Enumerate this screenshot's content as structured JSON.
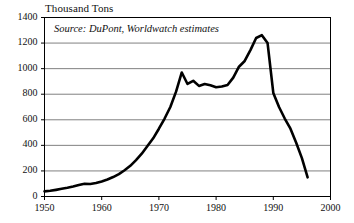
{
  "chart_data": {
    "type": "line",
    "title": "Thousand Tons",
    "ylabel": "Thousand Tons",
    "xlabel": "",
    "annotation": "Source: DuPont, Worldwatch estimates",
    "xlim": [
      1950,
      2000
    ],
    "ylim": [
      0,
      1400
    ],
    "grid": true,
    "legend": "none",
    "line_color": "#000000",
    "grid_color": "#808080",
    "axis_color": "#000000",
    "background_color": "#ffffff",
    "yticks": [
      0,
      200,
      400,
      600,
      800,
      1000,
      1200,
      1400
    ],
    "ytick_labels": [
      "0",
      "200",
      "400",
      "600",
      "800",
      "1000",
      "1200",
      "1400"
    ],
    "xticks": [
      1950,
      1960,
      1970,
      1980,
      1990,
      2000
    ],
    "xtick_labels": [
      "1950",
      "1960",
      "1970",
      "1980",
      "1990",
      "2000"
    ],
    "x": [
      1950,
      1951,
      1952,
      1953,
      1954,
      1955,
      1956,
      1957,
      1958,
      1959,
      1960,
      1961,
      1962,
      1963,
      1964,
      1965,
      1966,
      1967,
      1968,
      1969,
      1970,
      1971,
      1972,
      1973,
      1974,
      1975,
      1976,
      1977,
      1978,
      1979,
      1980,
      1981,
      1982,
      1983,
      1984,
      1985,
      1986,
      1987,
      1988,
      1989,
      1990,
      1991,
      1992,
      1993,
      1994,
      1995,
      1996
    ],
    "values": [
      40,
      45,
      52,
      60,
      68,
      78,
      90,
      100,
      98,
      105,
      118,
      133,
      152,
      175,
      205,
      240,
      285,
      335,
      395,
      455,
      530,
      610,
      700,
      820,
      970,
      880,
      905,
      865,
      880,
      870,
      855,
      860,
      872,
      930,
      1015,
      1060,
      1145,
      1240,
      1262,
      1200,
      810,
      700,
      610,
      530,
      420,
      300,
      150
    ],
    "series": [
      {
        "name": "CFC production",
        "values": [
          40,
          45,
          52,
          60,
          68,
          78,
          90,
          100,
          98,
          105,
          118,
          133,
          152,
          175,
          205,
          240,
          285,
          335,
          395,
          455,
          530,
          610,
          700,
          820,
          970,
          880,
          905,
          865,
          880,
          870,
          855,
          860,
          872,
          930,
          1015,
          1060,
          1145,
          1240,
          1262,
          1200,
          810,
          700,
          610,
          530,
          420,
          300,
          150
        ]
      }
    ]
  }
}
